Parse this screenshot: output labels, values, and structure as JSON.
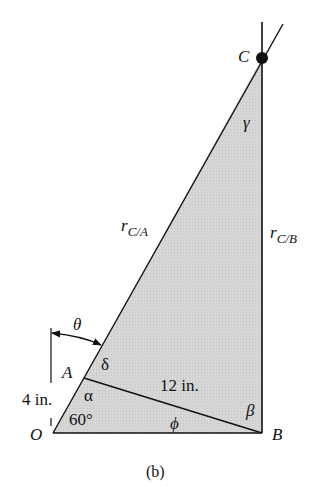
{
  "figure": {
    "caption": "(b)",
    "points": {
      "O": {
        "label": "O",
        "x": 53,
        "y": 433
      },
      "A": {
        "label": "A",
        "x": 84,
        "y": 378
      },
      "B": {
        "label": "B",
        "x": 262,
        "y": 433
      },
      "C": {
        "label": "C",
        "x": 262,
        "y": 58
      }
    },
    "vectors": {
      "r_CA": {
        "main": "r",
        "sub": "C/A"
      },
      "r_CB": {
        "main": "r",
        "sub": "C/B"
      }
    },
    "angles": {
      "theta": "θ",
      "delta": "δ",
      "alpha": "α",
      "angle_O": "60°",
      "phi": "ϕ",
      "beta": "β",
      "gamma": "γ"
    },
    "dimensions": {
      "OA": "4 in.",
      "AB": "12 in."
    },
    "colors": {
      "fill": "#d4d4d4",
      "stroke": "#111111"
    }
  }
}
